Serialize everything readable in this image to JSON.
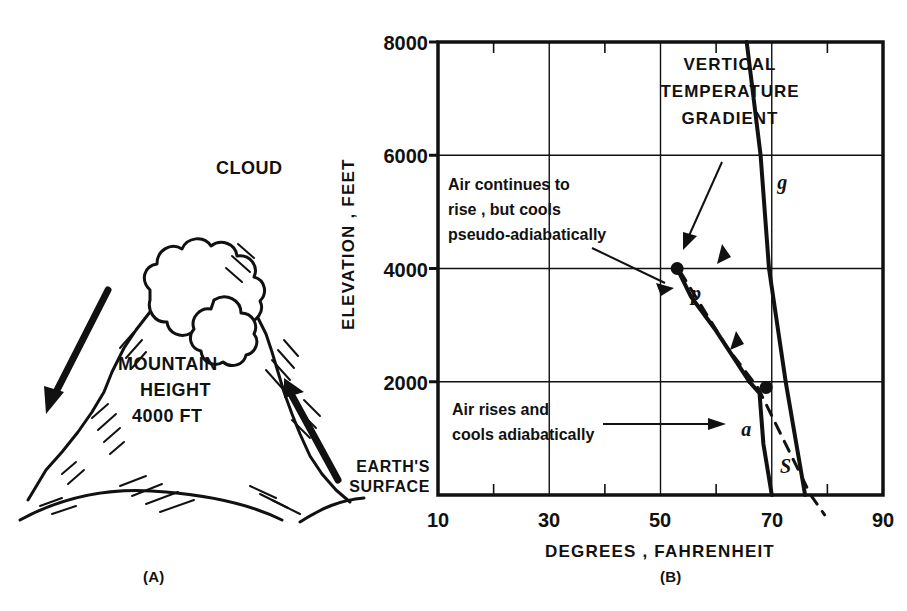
{
  "figure": {
    "panel_a_caption": "(A)",
    "panel_b_caption": "(B)"
  },
  "mountain": {
    "cloud_label": "CLOUD",
    "height_line1": "MOUNTAIN",
    "height_line2": "HEIGHT",
    "height_line3": "4000 FT",
    "arrow_left_name": "descending-air-arrow",
    "arrow_right_name": "ascending-air-arrow"
  },
  "chart_data": {
    "type": "line",
    "title": "",
    "xlabel": "DEGREES , FAHRENHEIT",
    "ylabel": "ELEVATION , FEET",
    "xlim": [
      10,
      90
    ],
    "ylim": [
      0,
      8000
    ],
    "xticks": [
      10,
      30,
      50,
      70,
      90
    ],
    "xtick_labels": [
      "10",
      "30",
      "50",
      "70",
      "90"
    ],
    "xminor": [
      20,
      40,
      60,
      80
    ],
    "yticks": [
      0,
      2000,
      4000,
      6000,
      8000
    ],
    "ytick_labels": [
      "",
      "2000",
      "4000",
      "6000",
      "8000"
    ],
    "grid": true,
    "origin_label_line1": "EARTH'S",
    "origin_label_line2": "SURFACE",
    "series": [
      {
        "name": "a",
        "label": "a",
        "description": "Air rises and cools adiabatically",
        "style": "solid",
        "points": [
          [
            70,
            0
          ],
          [
            68.5,
            900
          ],
          [
            67.8,
            1800
          ],
          [
            66.0,
            2000
          ]
        ]
      },
      {
        "name": "p",
        "label": "p",
        "description": "Air continues to rise, but cools pseudo-adiabatically",
        "style": "solid",
        "points": [
          [
            66.0,
            2000
          ],
          [
            60.0,
            2900
          ],
          [
            55.5,
            3500
          ],
          [
            53.0,
            4000
          ]
        ]
      },
      {
        "name": "dry-adiabat-dashed",
        "label": "",
        "description": "dry adiabat extension",
        "style": "dashed",
        "points": [
          [
            53.5,
            3950
          ],
          [
            62.0,
            2600
          ],
          [
            67.5,
            1900
          ],
          [
            77.0,
            0
          ],
          [
            79.5,
            -350
          ]
        ]
      },
      {
        "name": "g",
        "label": "g",
        "description": "Vertical temperature gradient",
        "style": "solid",
        "points": [
          [
            76.0,
            0
          ],
          [
            72.5,
            2000
          ],
          [
            69.5,
            4000
          ],
          [
            68.0,
            6000
          ],
          [
            65.5,
            8000
          ]
        ]
      }
    ],
    "markers": [
      {
        "name": "cloud-base-point",
        "x": 53.0,
        "y": 4000
      },
      {
        "name": "lifting-point",
        "x": 69.0,
        "y": 1900
      }
    ],
    "annotations": [
      {
        "name": "pseudo-adiabatic-note",
        "lines": [
          "Air continues to",
          "rise , but cools",
          "pseudo-adiabatically"
        ],
        "points_to": [
          53.0,
          4000
        ]
      },
      {
        "name": "adiabatic-note",
        "lines": [
          "Air rises and",
          "cools adiabatically"
        ],
        "points_to": [
          65.0,
          1100
        ]
      },
      {
        "name": "vertical-gradient-legend",
        "lines": [
          "VERTICAL",
          "TEMPERATURE",
          "GRADIENT"
        ],
        "points_to": [
          70.5,
          4600
        ]
      }
    ],
    "point_labels": [
      {
        "name": "surface-point-label",
        "text": "S",
        "x": 71.5,
        "y": 380
      },
      {
        "name": "curve-label-a",
        "text": "a",
        "x": 64.5,
        "y": 1050
      },
      {
        "name": "curve-label-p",
        "text": "p",
        "x": 55.5,
        "y": 3450
      },
      {
        "name": "curve-label-g",
        "text": "g",
        "x": 71.0,
        "y": 5400
      }
    ]
  }
}
